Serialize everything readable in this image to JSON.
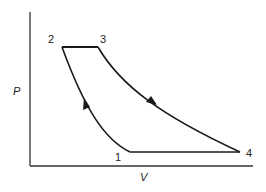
{
  "diagram": {
    "type": "P-V cycle diagram",
    "axes": {
      "x_label": "V",
      "y_label": "P"
    },
    "points": [
      {
        "id": "1",
        "label": "1",
        "x": 130,
        "y": 152
      },
      {
        "id": "2",
        "label": "2",
        "x": 62,
        "y": 47
      },
      {
        "id": "3",
        "label": "3",
        "x": 98,
        "y": 47
      },
      {
        "id": "4",
        "label": "4",
        "x": 240,
        "y": 152
      }
    ],
    "paths": [
      {
        "from": "1",
        "to": "2",
        "shape": "curve",
        "arrow": "up-left"
      },
      {
        "from": "2",
        "to": "3",
        "shape": "straight-horizontal"
      },
      {
        "from": "3",
        "to": "4",
        "shape": "curve",
        "arrow": "down-right"
      },
      {
        "from": "4",
        "to": "1",
        "shape": "straight-horizontal"
      }
    ],
    "colors": {
      "line": "#1a1a1a",
      "axis": "#333333",
      "background": "#ffffff"
    }
  }
}
